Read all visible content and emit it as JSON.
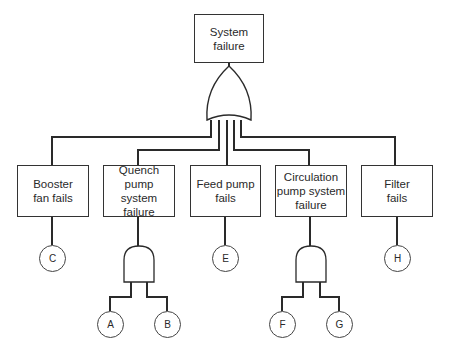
{
  "diagram": {
    "type": "fault-tree",
    "top_event": {
      "label": "System\nfailure",
      "line1": "System",
      "line2": "failure"
    },
    "top_gate": "OR",
    "intermediate_events": [
      {
        "id": "booster",
        "line1": "Booster",
        "line2": "fan fails",
        "line3": "",
        "basic_event": "C",
        "gate": null
      },
      {
        "id": "quench",
        "line1": "Quench pump",
        "line2": "system",
        "line3": "failure",
        "gate": "AND",
        "basic_events": [
          "A",
          "B"
        ]
      },
      {
        "id": "feed",
        "line1": "Feed pump",
        "line2": "fails",
        "line3": "",
        "basic_event": "E",
        "gate": null
      },
      {
        "id": "circulation",
        "line1": "Circulation",
        "line2": "pump system",
        "line3": "failure",
        "gate": "AND",
        "basic_events": [
          "F",
          "G"
        ]
      },
      {
        "id": "filter",
        "line1": "Filter",
        "line2": "fails",
        "line3": "",
        "basic_event": "H",
        "gate": null
      }
    ],
    "basic_events": {
      "A": "A",
      "B": "B",
      "C": "C",
      "E": "E",
      "F": "F",
      "G": "G",
      "H": "H"
    },
    "colors": {
      "line": "#2a2a2a",
      "caption": "#888888"
    }
  }
}
